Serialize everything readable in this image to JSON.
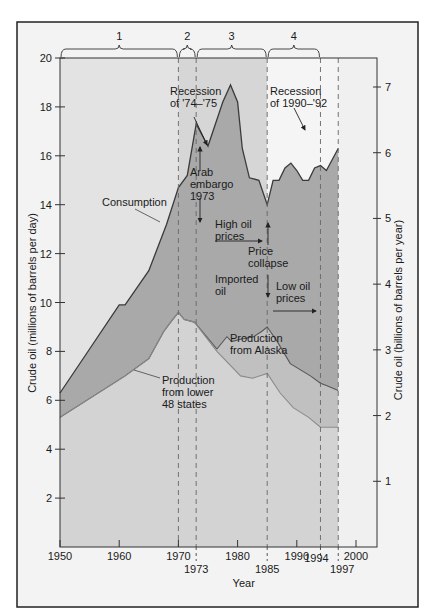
{
  "chart_data": {
    "type": "area",
    "title": "",
    "xlabel": "Year",
    "ylabel": "Crude oil (millions of barrels per day)",
    "ylabel_right": "Crude oil (billions of barrels per year)",
    "xlim": [
      1950,
      2003
    ],
    "ylim": [
      0,
      20
    ],
    "ylim_right": [
      0,
      7.4
    ],
    "grid": false,
    "x_ticks": [
      1950,
      1960,
      1970,
      1980,
      1990,
      2000
    ],
    "x_ticks_secondary": [
      1973,
      1985,
      1994,
      1997
    ],
    "y_ticks": [
      2,
      4,
      6,
      8,
      10,
      12,
      14,
      16,
      18,
      20
    ],
    "y_ticks_right": [
      1,
      2,
      3,
      4,
      5,
      6,
      7
    ],
    "periods": [
      {
        "label": "1",
        "start": 1950,
        "end": 1970
      },
      {
        "label": "2",
        "start": 1970,
        "end": 1973
      },
      {
        "label": "3",
        "start": 1973,
        "end": 1985
      },
      {
        "label": "4",
        "start": 1985,
        "end": 1994
      }
    ],
    "dashed_lines": [
      1970,
      1973,
      1985,
      1994,
      1997
    ],
    "series": [
      {
        "name": "Consumption",
        "x": [
          1950,
          1955,
          1960,
          1961,
          1965,
          1968,
          1970,
          1971.5,
          1973,
          1975,
          1977.5,
          1978.8,
          1980,
          1980.8,
          1982,
          1983.6,
          1985,
          1986,
          1987,
          1988,
          1989,
          1990,
          1991,
          1992,
          1993,
          1994,
          1995,
          1997
        ],
        "values": [
          6.3,
          8.1,
          9.9,
          9.9,
          11.3,
          13.2,
          14.7,
          15.2,
          17.3,
          16.4,
          18.2,
          18.9,
          18.2,
          16.3,
          15.1,
          15.0,
          14.0,
          15.0,
          15.0,
          15.5,
          15.7,
          15.4,
          15.0,
          15.0,
          15.5,
          15.6,
          15.4,
          16.3
        ]
      },
      {
        "name": "Production from lower 48 states + Alaska",
        "x": [
          1950,
          1961,
          1965,
          1967.5,
          1968.7,
          1970,
          1971,
          1972.7,
          1976.5,
          1978.2,
          1979,
          1980.5,
          1982.7,
          1984,
          1985,
          1986.7,
          1988.9,
          1992.3,
          1994,
          1995,
          1997
        ],
        "values": [
          5.3,
          7.0,
          7.7,
          8.8,
          9.2,
          9.6,
          9.3,
          9.2,
          8.1,
          8.6,
          8.4,
          8.5,
          8.6,
          8.8,
          9.0,
          8.4,
          7.5,
          7.0,
          6.7,
          6.6,
          6.4
        ]
      },
      {
        "name": "Production from lower 48 states",
        "x": [
          1950,
          1961,
          1965,
          1967.5,
          1968.7,
          1970,
          1971,
          1972.7,
          1976.5,
          1980.5,
          1982.5,
          1985,
          1987.2,
          1989.4,
          1992,
          1994,
          1997
        ],
        "values": [
          5.3,
          7.0,
          7.7,
          8.8,
          9.2,
          9.6,
          9.3,
          9.2,
          8.0,
          7.0,
          6.9,
          7.1,
          6.3,
          5.7,
          5.3,
          4.9,
          4.9
        ]
      }
    ],
    "annotations": [
      {
        "id": "recession-74-75",
        "lines": [
          "Recession",
          "of '74–'75"
        ]
      },
      {
        "id": "arab-embargo",
        "lines": [
          "Arab",
          "embargo",
          "1973"
        ]
      },
      {
        "id": "consumption",
        "lines": [
          "Consumption"
        ]
      },
      {
        "id": "high-oil-prices",
        "lines": [
          "High oil",
          "prices"
        ]
      },
      {
        "id": "price-collapse",
        "lines": [
          "Price",
          "collapse"
        ]
      },
      {
        "id": "imported-oil",
        "lines": [
          "Imported",
          "oil"
        ]
      },
      {
        "id": "low-oil-prices",
        "lines": [
          "Low oil",
          "prices"
        ]
      },
      {
        "id": "recession-90-92",
        "lines": [
          "Recession",
          "of 1990–'92"
        ]
      },
      {
        "id": "production-alaska",
        "lines": [
          "Production",
          "from  Alaska"
        ]
      },
      {
        "id": "production-lower48",
        "lines": [
          "Production",
          "from lower",
          "48 states"
        ]
      }
    ],
    "colors": {
      "period1_bg": "#e3e3e3",
      "period23_bg": "#d6d6d6",
      "period4_bg": "#f5f5f5",
      "tail_bg": "#f0f0f0",
      "imported_fill": "#a9a9a9",
      "alaska_fill": "#c0c0c0",
      "lower48_fill": "#d3d3d3",
      "line": "#3a3a3a",
      "lower48_line": "#8a8a8a"
    }
  }
}
